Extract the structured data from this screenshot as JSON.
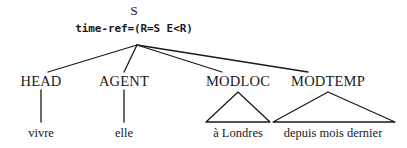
{
  "figure": {
    "type": "syntactic-tree",
    "background_color": "#ffffff",
    "line_color": "#1a1a1a",
    "text_color": "#1a1a1a"
  },
  "root": {
    "label": "S",
    "feature": "time-ref=(R=S E<R)"
  },
  "branches": [
    {
      "category": "HEAD",
      "leaf": "vivre",
      "connector": "line"
    },
    {
      "category": "AGENT",
      "leaf": "elle",
      "connector": "line"
    },
    {
      "category": "MODLOC",
      "leaf": "à Londres",
      "connector": "triangle"
    },
    {
      "category": "MODTEMP",
      "leaf": "depuis mois dernier",
      "connector": "triangle"
    }
  ]
}
